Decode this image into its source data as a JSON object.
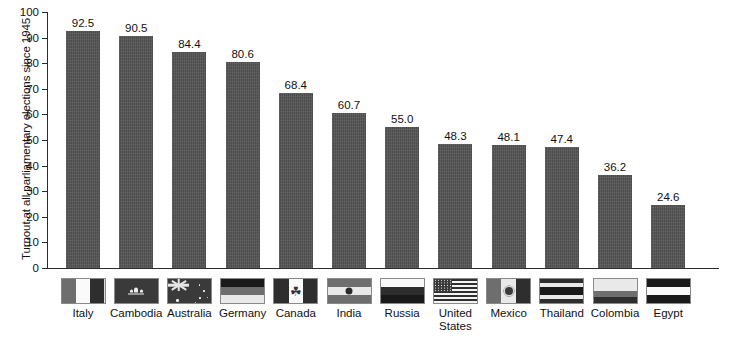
{
  "chart_data": {
    "type": "bar",
    "title": "",
    "xlabel": "",
    "ylabel": "Turnout at all parliamentary elections since 1945",
    "ylim": [
      0,
      100
    ],
    "ytick_labels": [
      "100",
      "90",
      "80",
      "70",
      "60",
      "50",
      "40",
      "30",
      "20",
      "10",
      "0"
    ],
    "ytick_values": [
      100,
      90,
      80,
      70,
      60,
      50,
      40,
      30,
      20,
      10,
      0
    ],
    "grid": false,
    "legend": "none",
    "categories": [
      "Italy",
      "Cambodia",
      "Australia",
      "Germany",
      "Canada",
      "India",
      "Russia",
      "United States",
      "Mexico",
      "Thailand",
      "Colombia",
      "Egypt"
    ],
    "values": [
      92.5,
      90.5,
      84.4,
      80.6,
      68.4,
      60.7,
      55.0,
      48.3,
      48.1,
      47.4,
      36.2,
      24.6
    ],
    "value_labels": [
      "92.5",
      "90.5",
      "84.4",
      "80.6",
      "68.4",
      "60.7",
      "55.0",
      "48.3",
      "48.1",
      "47.4",
      "36.2",
      "24.6"
    ],
    "bar_color": "#545454",
    "axis_color": "#2b2b2b",
    "background_color": "#ffffff"
  },
  "axis": {
    "y_title": "Turnout at all parliamentary elections since 1945"
  },
  "flags": [
    {
      "country": "Italy",
      "icon": "flag-italy"
    },
    {
      "country": "Cambodia",
      "icon": "flag-cambodia"
    },
    {
      "country": "Australia",
      "icon": "flag-australia"
    },
    {
      "country": "Germany",
      "icon": "flag-germany"
    },
    {
      "country": "Canada",
      "icon": "flag-canada"
    },
    {
      "country": "India",
      "icon": "flag-india"
    },
    {
      "country": "Russia",
      "icon": "flag-russia"
    },
    {
      "country": "United States",
      "icon": "flag-united-states"
    },
    {
      "country": "Mexico",
      "icon": "flag-mexico"
    },
    {
      "country": "Thailand",
      "icon": "flag-thailand"
    },
    {
      "country": "Colombia",
      "icon": "flag-colombia"
    },
    {
      "country": "Egypt",
      "icon": "flag-egypt"
    }
  ],
  "labels": {
    "l0": "Italy",
    "l1": "Cambodia",
    "l2": "Australia",
    "l3": "Germany",
    "l4": "Canada",
    "l5": "India",
    "l6": "Russia",
    "l7": "United\nStates",
    "l8": "Mexico",
    "l9": "Thailand",
    "l10": "Colombia",
    "l11": "Egypt"
  }
}
